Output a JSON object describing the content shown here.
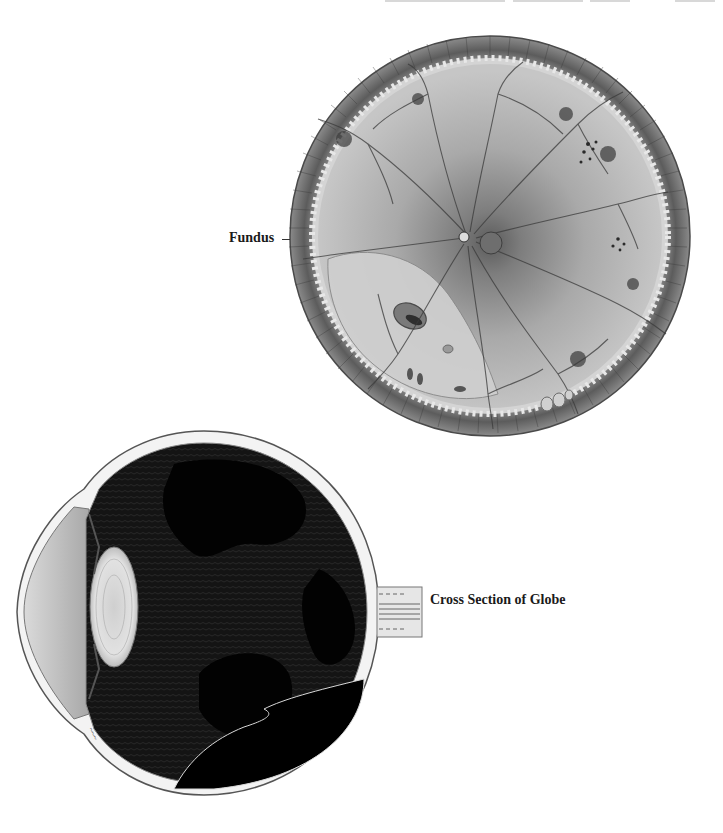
{
  "page": {
    "background": "#ffffff",
    "header_fragment": "cropped running header (illegible)"
  },
  "figures": [
    {
      "id": "fundus",
      "label": "Fundus",
      "description": "Circular fundus illustration: dark radial peripheral rim with serrated ora serrata, light grey retina with branching dark vessels radiating from a central optic disc and macula, lighter detached region at lower left with a hole, pigment clumps at right, small bubbles at bottom edge",
      "colors": {
        "rim": "#5a5a5a",
        "retina": "#bdbdbd",
        "vessels": "#3a3a3a",
        "disc": "#6e6e6e"
      }
    },
    {
      "id": "globe",
      "label": "Cross Section of Globe",
      "description": "Sagittal cross section of eyeball: white sclera and cornea outline, grey anterior chamber, pale oval lens, black vitreous cavity with fibrous textured membranes, optic nerve stump exiting on right, detached retina folds at lower right",
      "colors": {
        "sclera": "#f2f2f2",
        "vitreous": "#050505",
        "lens": "#d9d9d9",
        "cornea_chamber": "#b8b8b8"
      },
      "signature": "artist signature (illegible)"
    }
  ]
}
